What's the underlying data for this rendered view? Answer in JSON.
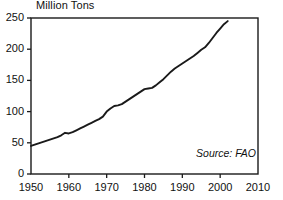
{
  "chart_data": {
    "type": "line",
    "title": "Million Tons",
    "xlabel": "",
    "ylabel": "",
    "xlim": [
      1950,
      2010
    ],
    "ylim": [
      0,
      250
    ],
    "grid": false,
    "legend": null,
    "annotations": [
      {
        "name": "source",
        "text": "Source: FAO",
        "position": "bottom-right-inside",
        "style": "italic"
      }
    ],
    "yticks": [
      0,
      50,
      100,
      150,
      200,
      250
    ],
    "ytick_labels": [
      "0",
      "50",
      "100",
      "150",
      "200",
      "250"
    ],
    "xticks": [
      1950,
      1960,
      1970,
      1980,
      1990,
      2000,
      2010
    ],
    "xtick_labels": [
      "1950",
      "1960",
      "1970",
      "1980",
      "1990",
      "2000",
      "2010"
    ],
    "line_color": "#1a1a1a",
    "line_width": 1.9,
    "series": [
      {
        "name": "World Meat Production",
        "x": [
          1950,
          1951,
          1952,
          1953,
          1954,
          1955,
          1956,
          1957,
          1958,
          1959,
          1960,
          1961,
          1962,
          1963,
          1964,
          1965,
          1966,
          1967,
          1968,
          1969,
          1970,
          1971,
          1972,
          1973,
          1974,
          1975,
          1976,
          1977,
          1978,
          1979,
          1980,
          1981,
          1982,
          1983,
          1984,
          1985,
          1986,
          1987,
          1988,
          1989,
          1990,
          1991,
          1992,
          1993,
          1994,
          1995,
          1996,
          1997,
          1998,
          1999,
          2000,
          2001,
          2002
        ],
        "values": [
          45,
          47,
          49,
          51,
          53,
          55,
          57,
          59,
          62,
          66,
          65,
          67,
          70,
          73,
          76,
          79,
          82,
          85,
          88,
          92,
          100,
          105,
          109,
          110,
          112,
          116,
          120,
          124,
          128,
          132,
          136,
          137,
          138,
          142,
          147,
          152,
          158,
          164,
          169,
          173,
          177,
          181,
          185,
          189,
          194,
          199,
          203,
          210,
          218,
          226,
          233,
          240,
          245
        ]
      }
    ]
  }
}
